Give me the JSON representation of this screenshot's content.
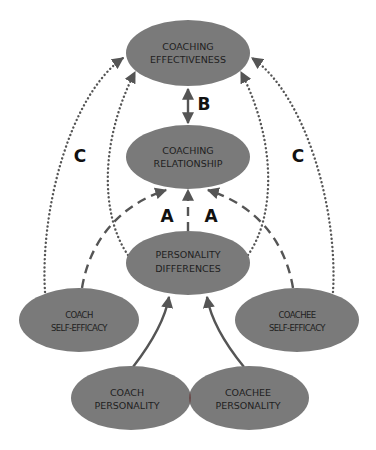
{
  "diagram": {
    "colors": {
      "node_fill": "#7a7a7a",
      "node_overlap": "#6a4a4a",
      "line": "#555555",
      "text": "#1e1e1e",
      "background": "#ffffff"
    },
    "nodes": {
      "coaching_effectiveness": {
        "line1": "COACHING",
        "line2": "EFFECTIVENESS"
      },
      "coaching_relationship": {
        "line1": "COACHING",
        "line2": "RELATIONSHIP"
      },
      "personality_differences": {
        "line1": "PERSONALITY",
        "line2": "DIFFERENCES"
      },
      "coach_self_efficacy": {
        "line1": "COACH",
        "line2": "SELF-EFFICACY"
      },
      "coachee_self_efficacy": {
        "line1": "COACHEE",
        "line2": "SELF-EFFICACY"
      },
      "coach_personality": {
        "line1": "COACH",
        "line2": "PERSONALITY"
      },
      "coachee_personality": {
        "line1": "COACHEE",
        "line2": "PERSONALITY"
      }
    },
    "path_labels": {
      "a_left": "A",
      "a_right": "A",
      "b": "B",
      "c_left": "C",
      "c_right": "C"
    },
    "edges": [
      {
        "from": "coach_personality",
        "to": "personality_differences",
        "style": "solid"
      },
      {
        "from": "coachee_personality",
        "to": "personality_differences",
        "style": "solid"
      },
      {
        "from": "personality_differences",
        "to": "coaching_relationship",
        "style": "dashed",
        "label": "A"
      },
      {
        "from": "coach_self_efficacy",
        "to": "coaching_relationship",
        "style": "dashed",
        "label": "A"
      },
      {
        "from": "coachee_self_efficacy",
        "to": "coaching_relationship",
        "style": "dashed",
        "label": "A"
      },
      {
        "from": "coaching_relationship",
        "to": "coaching_effectiveness",
        "style": "solid-bidirectional",
        "label": "B"
      },
      {
        "from": "coach_self_efficacy",
        "to": "coaching_effectiveness",
        "style": "dotted",
        "label": "C"
      },
      {
        "from": "coachee_self_efficacy",
        "to": "coaching_effectiveness",
        "style": "dotted",
        "label": "C"
      },
      {
        "from": "personality_differences",
        "to": "coaching_effectiveness",
        "style": "dotted"
      }
    ]
  }
}
